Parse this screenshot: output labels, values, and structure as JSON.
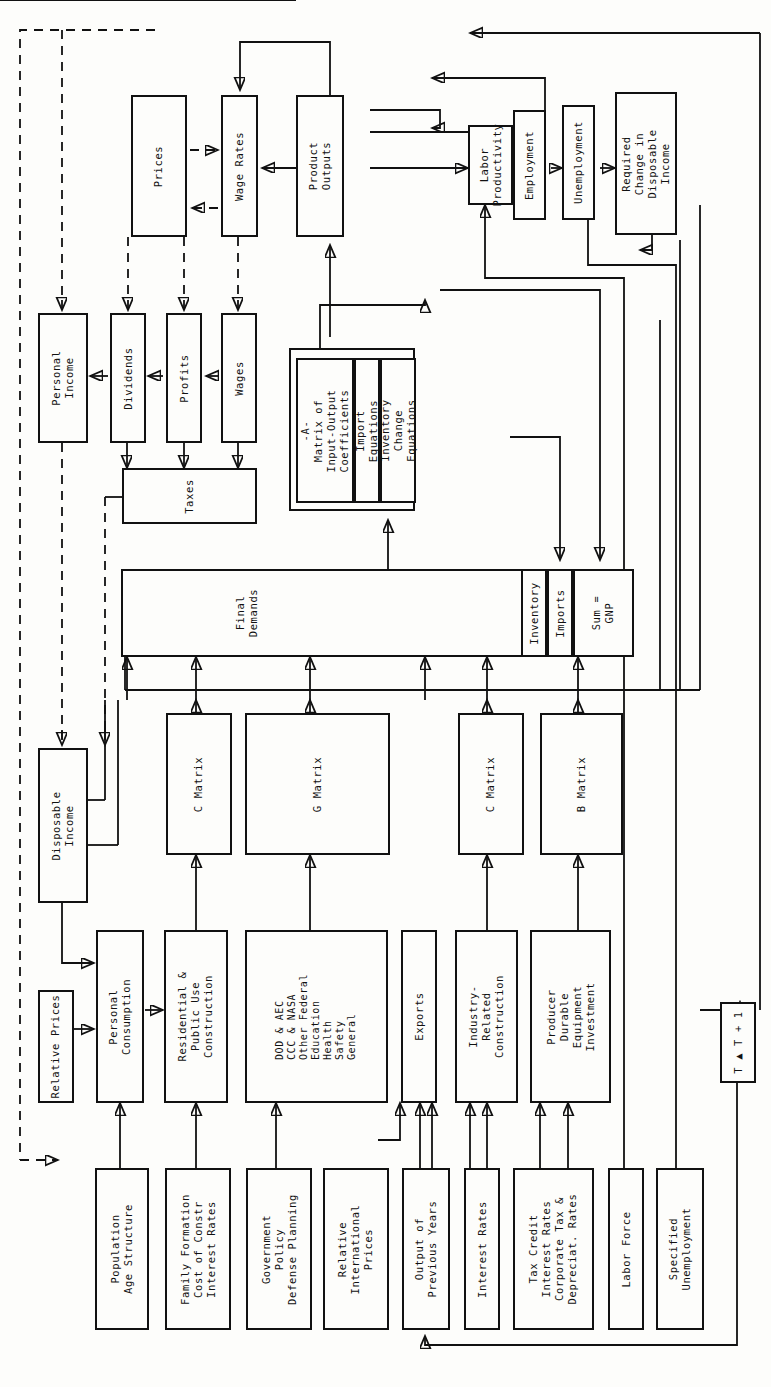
{
  "diagram": {
    "orientation": "rotated-90",
    "line_color": "#111111",
    "background": "#fdfdfb"
  },
  "boxes": {
    "prices": "Prices",
    "wage_rates": "Wage Rates",
    "product_outputs": "Product\nOutputs",
    "labor_productivity": "Labor\nProductivity",
    "employment": "Employment",
    "unemployment": "Unemployment",
    "required_change": "Required\nChange in\nDisposable\nIncome",
    "personal_income": "Personal\nIncome",
    "dividends": "Dividends",
    "profits": "Profits",
    "wages": "Wages",
    "taxes": "Taxes",
    "a_matrix": "-A-\nMatrix of\nInput-Output\nCoefficients",
    "import_equations": "Import\nEquations",
    "inventory_change_equations": "Inventory\nChange\nEquations",
    "final_demands": "Final\nDemands",
    "inventory": "Inventory",
    "imports": "Imports",
    "sum_gnp": "Sum =\nGNP",
    "c_matrix_1": "C Matrix",
    "g_matrix": "G Matrix",
    "c_matrix_2": "C Matrix",
    "b_matrix": "B Matrix",
    "disposable_income": "Disposable\nIncome",
    "personal_consumption": "Personal\nConsumption",
    "residential_construction": "Residential &\nPublic Use\nConstruction",
    "government_programs": "DOD & AEC\nCCC & NASA\nOther Federal\nEducation\nHealth\nSafety\nGeneral",
    "exports": "Exports",
    "industry_related_construction": "Industry-\nRelated\nConstruction",
    "producer_durable": "Producer\nDurable\nEquipment\nInvestment",
    "relative_prices": "Relative Prices",
    "population_age": "Population\nAge Structure",
    "family_formation": "Family Formation\nCost of Constr\nInterest Rates",
    "government_policy": "Government\nPolicy\nDefense Planning",
    "relative_intl_prices": "Relative\nInternational\nPrices",
    "output_previous_years": "Output of\nPrevious Years",
    "interest_rates": "Interest Rates",
    "tax_credit": "Tax Credit\nInterest Rates\nCorporate Tax &\nDepreciat. Rates",
    "labor_force": "Labor Force",
    "specified_unemployment": "Specified\nUnemployment",
    "time_step": "T ▲ T + 1"
  }
}
